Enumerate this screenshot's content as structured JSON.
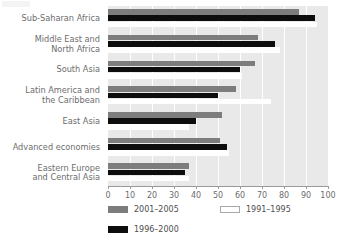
{
  "chart_data": {
    "type": "bar",
    "orientation": "horizontal",
    "title": "",
    "subtitle": "",
    "xlabel": "",
    "ylabel": "",
    "xlim": [
      0,
      100
    ],
    "xticks": [
      0,
      10,
      20,
      30,
      40,
      50,
      60,
      70,
      80,
      90,
      100
    ],
    "xtick_labels": [
      "0",
      "10",
      "20",
      "30",
      "40",
      "50",
      "60",
      "70",
      "80",
      "90",
      "100"
    ],
    "grid": "vertical white gridlines on light gray plot background",
    "legend_position": "below plot, two columns",
    "categories": [
      "Sub-Saharan Africa",
      "Middle East and North Africa",
      "South Asia",
      "Latin America and the Caribbean",
      "East Asia",
      "Advanced economies",
      "Eastern Europe and Central Asia"
    ],
    "category_label_lines": [
      [
        "Sub-Saharan Africa"
      ],
      [
        "Middle East and",
        "North Africa"
      ],
      [
        "South Asia"
      ],
      [
        "Latin America and",
        "the Caribbean"
      ],
      [
        "East Asia"
      ],
      [
        "Advanced economies"
      ],
      [
        "Eastern Europe",
        "and Central Asia"
      ]
    ],
    "series": [
      {
        "name": "2001–2005",
        "color": "#7d7d7d",
        "values": [
          87,
          68,
          67,
          58,
          52,
          51,
          37
        ]
      },
      {
        "name": "1996–2000",
        "color": "#0d0d0d",
        "values": [
          94,
          76,
          60,
          50,
          40,
          54,
          35
        ]
      },
      {
        "name": "1991–1995",
        "color": "#ffffff",
        "values": [
          95,
          78,
          61,
          74,
          37,
          55,
          37
        ]
      }
    ]
  },
  "legend": {
    "items": [
      {
        "label": "2001–2005",
        "swatch": "gray"
      },
      {
        "label": "1991–1995",
        "swatch": "white"
      },
      {
        "label": "1996–2000",
        "swatch": "black"
      }
    ]
  },
  "colors": {
    "series_2001_2005": "#7d7d7d",
    "series_1996_2000": "#0d0d0d",
    "series_1991_1995": "#ffffff",
    "plot_background": "#e9e9e9",
    "gridline": "#ffffff",
    "axis": "#9a9a9a",
    "text": "#6d6d6d"
  }
}
